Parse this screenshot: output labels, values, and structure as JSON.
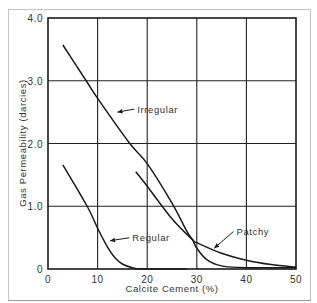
{
  "chart_data": {
    "type": "line",
    "title": "",
    "xlabel": "Calcite Cement (%)",
    "ylabel": "Gas Permeability (darcies)",
    "xlim": [
      0,
      50
    ],
    "ylim": [
      0,
      4.0
    ],
    "grid": true,
    "x_ticks": [
      0,
      10,
      20,
      30,
      40,
      50
    ],
    "x_tick_labels": [
      "0",
      "10",
      "20",
      "30",
      "40",
      "50"
    ],
    "y_ticks": [
      0,
      1.0,
      2.0,
      3.0,
      4.0
    ],
    "y_tick_labels": [
      "0",
      "1.0",
      "2.0",
      "3.0",
      "4.0"
    ],
    "legend": "none (inline annotations with arrows)",
    "series": [
      {
        "name": "Irregular",
        "x": [
          3,
          7.7,
          10,
          16.5,
          20,
          25,
          28,
          29.2,
          30,
          32,
          35,
          40,
          50
        ],
        "y": [
          3.57,
          3.0,
          2.72,
          2.0,
          1.68,
          1.05,
          0.6,
          0.46,
          0.33,
          0.15,
          0.05,
          0.02,
          0.02
        ]
      },
      {
        "name": "Patchy",
        "x": [
          17.7,
          20,
          25,
          29.2,
          30,
          35,
          40,
          45,
          50
        ],
        "y": [
          1.55,
          1.32,
          0.8,
          0.46,
          0.42,
          0.25,
          0.14,
          0.07,
          0.03
        ]
      },
      {
        "name": "Regular",
        "x": [
          3,
          7.9,
          10,
          12,
          13.5,
          15,
          17,
          19,
          28
        ],
        "y": [
          1.66,
          1.0,
          0.65,
          0.35,
          0.18,
          0.08,
          0.02,
          0.0,
          0.0
        ]
      }
    ],
    "annotations": [
      {
        "text": "Irregular",
        "x": 18,
        "y": 2.5,
        "arrow_to": [
          14,
          2.5
        ]
      },
      {
        "text": "Regular",
        "x": 17,
        "y": 0.45,
        "arrow_to": [
          12.5,
          0.45
        ]
      },
      {
        "text": "Patchy",
        "x": 38,
        "y": 0.55,
        "arrow_to": [
          33.5,
          0.33
        ]
      }
    ]
  },
  "colors": {
    "line": "#1a1a1a",
    "grid": "#222222",
    "frame": "#bbbbbb",
    "text": "#333333"
  }
}
